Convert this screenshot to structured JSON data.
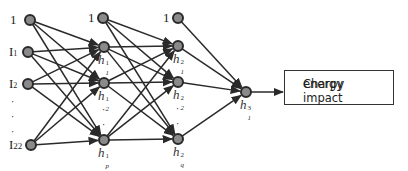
{
  "diagram": {
    "type": "feedforward-neural-network",
    "colors": {
      "node_fill": "#8a8a8a",
      "node_stroke": "#2a2a2a",
      "edge": "#2a2a2a"
    },
    "input_layer": {
      "nodes": [
        {
          "label": "1",
          "x": 30,
          "y": 20
        },
        {
          "label": "I1",
          "x": 28,
          "y": 52
        },
        {
          "label": "I2",
          "x": 28,
          "y": 84
        },
        {
          "label": "I22",
          "x": 31,
          "y": 145
        }
      ],
      "ellipsis": "·"
    },
    "hidden_layer_1": {
      "bias": {
        "label": "1",
        "x": 103,
        "y": 18
      },
      "nodes": [
        {
          "symbol": "h",
          "sub": "1",
          "sup": "1",
          "x": 104,
          "y": 47
        },
        {
          "symbol": "h",
          "sub": "2",
          "sup": "1",
          "x": 104,
          "y": 83
        },
        {
          "symbol": "h",
          "sub": "p",
          "sup": "1",
          "x": 104,
          "y": 140
        }
      ],
      "ellipsis": "·"
    },
    "hidden_layer_2": {
      "bias": {
        "label": "1",
        "x": 178,
        "y": 18
      },
      "nodes": [
        {
          "symbol": "h",
          "sub": "1",
          "sup": "2",
          "x": 178,
          "y": 46
        },
        {
          "symbol": "h",
          "sub": "2",
          "sup": "2",
          "x": 178,
          "y": 82
        },
        {
          "symbol": "h",
          "sub": "q",
          "sup": "2",
          "x": 178,
          "y": 139
        }
      ],
      "ellipsis": "·"
    },
    "output_layer": {
      "nodes": [
        {
          "symbol": "h",
          "sub": "1",
          "sup": "3",
          "x": 246,
          "y": 92
        }
      ]
    },
    "output_box": {
      "line1": "Charpy impact",
      "line2": "energy"
    }
  }
}
